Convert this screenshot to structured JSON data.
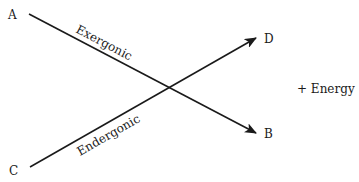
{
  "diagram": {
    "nodes": {
      "A": "A",
      "B": "B",
      "C": "C",
      "D": "D"
    },
    "edges": [
      {
        "from": "A",
        "to": "B",
        "label": "Exergonic"
      },
      {
        "from": "C",
        "to": "D",
        "label": "Endergonic"
      }
    ],
    "side_text": "+ Energy",
    "stroke_color": "#1a1a1a"
  }
}
